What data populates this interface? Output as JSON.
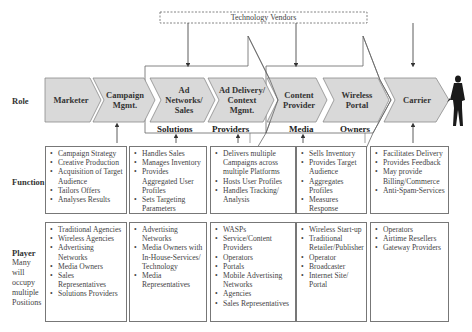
{
  "vendors_label": "Technology Vendors",
  "row_labels": {
    "role": "Role",
    "function": "Function",
    "player": "Player",
    "player_sub": "Many will occupy multiple Positions"
  },
  "roles": [
    {
      "label": "Marketer"
    },
    {
      "label": "Campaign Mgmt."
    },
    {
      "label": "Ad Networks/ Sales"
    },
    {
      "label": "Ad Delivery/ Context Mgmt."
    },
    {
      "label": "Content Provider"
    },
    {
      "label": "Wireless Portal"
    },
    {
      "label": "Carrier"
    }
  ],
  "groups": {
    "solutions": "Solutions",
    "providers": "Providers",
    "media": "Media",
    "owners": "Owners"
  },
  "functions": [
    {
      "items": [
        "Campaign Strategy",
        "Creative Production",
        "Acquisition of Target Audience",
        "Tailors Offers",
        "Analyses Results"
      ]
    },
    {
      "items": [
        "Handles Sales",
        "Manages Inventory",
        "Provides Aggregated User Profiles",
        "Sets Targeting Parameters"
      ]
    },
    {
      "items": [
        "Delivers multiple Campaigns across multiple Platforms",
        "Hosts User Profiles",
        "Handles Tracking/ Analysis"
      ]
    },
    {
      "items": [
        "Sells Inventory",
        "Provides Target Audience",
        "Aggregates Profiles",
        "Measures Response"
      ]
    },
    {
      "items": [
        "Facilitates Delivery",
        "Provides Feedback",
        "May provide Billing/Commerce",
        "Anti-Spam-Services"
      ]
    }
  ],
  "players": [
    {
      "items": [
        "Traditional Agencies",
        "Wireless Agencies",
        "Advertising Networks",
        "Media Owners",
        "Sales Representatives",
        "Solutions Providers"
      ]
    },
    {
      "items": [
        "Advertising Networks",
        "Media Owners with In-House-Services/ Technology",
        "Media Representatives"
      ]
    },
    {
      "items": [
        "WASPs",
        "Service/Content Providers",
        "Operators",
        "Portals",
        "Mobile Advertising Networks",
        "Agencies",
        "Sales Representatives"
      ]
    },
    {
      "items": [
        "Wireless Start-up",
        "Traditional Retailer/Publisher",
        "Operator",
        "Broadcaster",
        "Internet Site/ Portal"
      ]
    },
    {
      "items": [
        "Operators",
        "Airtime Resellers",
        "Gateway Providers"
      ]
    }
  ],
  "colors": {
    "chevron_fill": "#d9d9d9",
    "chevron_stroke": "#8a8a8a",
    "line": "#555555",
    "figure": "#1a1a1a"
  }
}
